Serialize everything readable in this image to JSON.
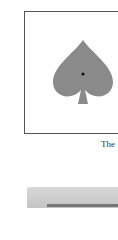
{
  "figure": {
    "symbol": "spade-icon",
    "symbol_color": "#8a8a8a",
    "center_dot_color": "#111111"
  },
  "caption": {
    "text": "The"
  },
  "photo": {
    "description": "partial grayscale photograph"
  }
}
